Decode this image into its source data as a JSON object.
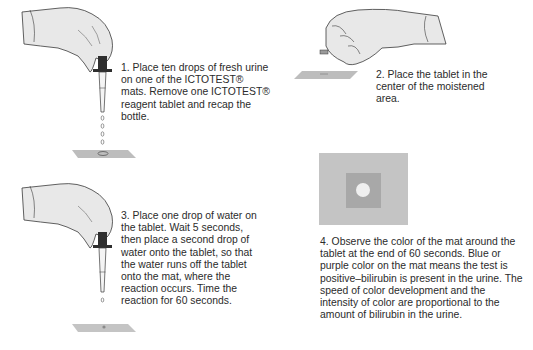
{
  "steps": [
    {
      "number": "1",
      "text": "1. Place ten drops of fresh urine on one of the ICTOTEST® mats. Remove one ICTOTEST® reagent tablet and recap the bottle.",
      "illustration": "gloved-hand-dropper-dripping-onto-mat"
    },
    {
      "number": "2",
      "text": "2. Place the tablet in the center of the moistened area.",
      "illustration": "gloved-hand-placing-tablet-on-mat"
    },
    {
      "number": "3",
      "text": "3. Place one drop of water on the tablet.  Wait 5 seconds, then place a second drop of water onto the tablet, so that the water runs off the tablet onto the mat, where the reaction occurs. Time the reaction for 60 seconds.",
      "illustration": "gloved-hand-dropper-single-drop-onto-mat"
    },
    {
      "number": "4",
      "text": "4. Observe the color of the mat around the tablet at the end of 60 seconds. Blue or purple color on the mat means the test is positive–bilirubin is present in the urine. The speed of color development and the intensity of color are proportional to the amount of bilirubin in the urine.",
      "illustration": "mat-top-view-with-tablet-and-color-ring"
    }
  ],
  "colors": {
    "background": "#ffffff",
    "text": "#2b2b2b",
    "glove": "#e6e6e6",
    "outline": "#3a3a3a",
    "mat_outer": "#c4c4c4",
    "mat_inner": "#a8a8a8",
    "tablet": "#efefef"
  }
}
